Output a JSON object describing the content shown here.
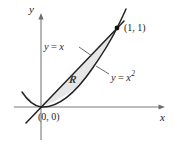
{
  "figure": {
    "background_color": "#ffffff",
    "axes": {
      "x_label": "x",
      "y_label": "y",
      "axis_color": "#6e6e6e",
      "origin_px": [
        41,
        107
      ]
    },
    "curves": [
      {
        "name": "line",
        "equation_text": "y = x",
        "label_lhs": "y",
        "label_eq": "=",
        "label_rhs": "x",
        "color": "#1c1c1c"
      },
      {
        "name": "parabola",
        "equation_text": "y = x2",
        "label_lhs": "y",
        "label_eq": "=",
        "label_rhs": "x",
        "label_exponent": "2",
        "color": "#1c1c1c"
      }
    ],
    "points": [
      {
        "name": "upper-intersection",
        "label": "(1, 1)",
        "px": [
          117,
          28
        ]
      },
      {
        "name": "origin-intersection",
        "label": "(0, 0)",
        "px": [
          41,
          107
        ]
      }
    ],
    "region": {
      "name": "R",
      "label": "R",
      "fill_color": "#e6e6e6",
      "stroke_color": "#4a4a4a"
    }
  }
}
